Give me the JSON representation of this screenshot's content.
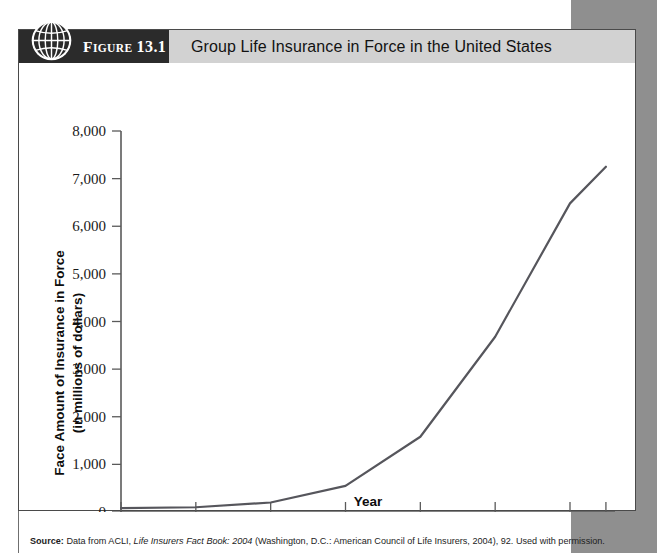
{
  "figure": {
    "icon": "globe-icon",
    "label_prefix": "F",
    "label_smallcaps": "IGURE",
    "label_number": "13.1",
    "label_full": "Figure 13.1",
    "title": "Group Life Insurance in Force in the United States",
    "header_dark_color": "#2b2b2b",
    "header_strip_color": "#d2d2d2",
    "page_margin_color": "#8f8f8f"
  },
  "source": {
    "prefix": "Source:",
    "text_before_italic": " Data from ACLI, ",
    "italic_title": "Life Insurers Fact Book: 2004",
    "text_after_italic": " (Washington, D.C.: American Council of Life Insurers, 2004), 92. Used with permission."
  },
  "chart_data": {
    "type": "line",
    "title": "Group Life Insurance in Force in the United States",
    "xlabel": "Year",
    "ylabel": "Face Amount of Insurance in Force (in millions of dollars)",
    "ylabel_line1": "Face Amount of Insurance in Force",
    "ylabel_line2": "(in millions of dollars)",
    "x": [
      1940,
      1950,
      1960,
      1970,
      1980,
      1990,
      2000,
      2003
    ],
    "values": [
      80,
      100,
      200,
      550,
      1580,
      3680,
      6480,
      7250
    ],
    "series": [
      {
        "name": "Group Life Insurance in Force",
        "values": [
          80,
          100,
          200,
          550,
          1580,
          3680,
          6480,
          7250
        ]
      }
    ],
    "xticks": [
      "1940",
      "1950",
      "1960",
      "1970",
      "1980",
      "1990",
      "2000",
      "2003"
    ],
    "yticks": [
      "0",
      "1,000",
      "2,000",
      "3,000",
      "4,000",
      "5,000",
      "6,000",
      "7,000",
      "8,000"
    ],
    "ytick_values": [
      0,
      1000,
      2000,
      3000,
      4000,
      5000,
      6000,
      7000,
      8000
    ],
    "ylim": [
      0,
      8000
    ],
    "xlim": [
      1940,
      2003
    ],
    "grid": false,
    "legend": false,
    "line_color": "#56565c"
  }
}
